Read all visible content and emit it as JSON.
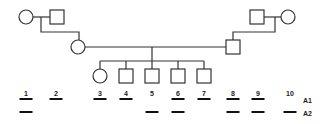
{
  "pedigree": {
    "line_color": "#333333",
    "generation_1": [
      {
        "id": "grandmother-left",
        "sex": "female",
        "cx": 26,
        "cy": 17
      },
      {
        "id": "grandfather-left",
        "sex": "male",
        "cx": 57,
        "cy": 17
      },
      {
        "id": "grandfather-right",
        "sex": "male",
        "cx": 257,
        "cy": 17
      },
      {
        "id": "grandmother-right",
        "sex": "female",
        "cx": 288,
        "cy": 17
      }
    ],
    "generation_2": [
      {
        "id": "mother",
        "sex": "female",
        "cx": 78,
        "cy": 47
      },
      {
        "id": "father",
        "sex": "male",
        "cx": 233,
        "cy": 47
      }
    ],
    "generation_3": [
      {
        "id": "child-1",
        "sex": "female",
        "cx": 100,
        "cy": 76
      },
      {
        "id": "child-2",
        "sex": "male",
        "cx": 126,
        "cy": 76
      },
      {
        "id": "child-3",
        "sex": "male",
        "cx": 152,
        "cy": 76
      },
      {
        "id": "child-4",
        "sex": "male",
        "cx": 178,
        "cy": 76
      },
      {
        "id": "child-5",
        "sex": "male",
        "cx": 204,
        "cy": 76
      }
    ]
  },
  "markers": {
    "allele_labels": [
      "A1",
      "A2"
    ],
    "individuals": [
      {
        "num": "1",
        "x": 26,
        "A1": true,
        "A2": true
      },
      {
        "num": "2",
        "x": 56,
        "A1": true,
        "A2": false
      },
      {
        "num": "3",
        "x": 100,
        "A1": true,
        "A2": false
      },
      {
        "num": "4",
        "x": 126,
        "A1": true,
        "A2": false
      },
      {
        "num": "5",
        "x": 152,
        "A1": false,
        "A2": true
      },
      {
        "num": "6",
        "x": 178,
        "A1": true,
        "A2": true
      },
      {
        "num": "7",
        "x": 204,
        "A1": true,
        "A2": false
      },
      {
        "num": "8",
        "x": 233,
        "A1": true,
        "A2": true
      },
      {
        "num": "9",
        "x": 258,
        "A1": true,
        "A2": true
      },
      {
        "num": "10",
        "x": 290,
        "A1": false,
        "A2": true
      }
    ]
  }
}
